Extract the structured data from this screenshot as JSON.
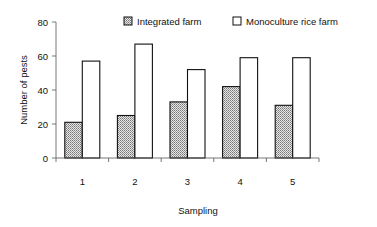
{
  "chart_data": {
    "type": "bar",
    "title": "",
    "xlabel": "Sampling",
    "ylabel": "Number of pests",
    "categories": [
      "1",
      "2",
      "3",
      "4",
      "5"
    ],
    "series": [
      {
        "name": "Integrated farm",
        "values": [
          21,
          25,
          33,
          42,
          31
        ],
        "fill": "dotted-gray"
      },
      {
        "name": "Monoculture rice farm",
        "values": [
          57,
          67,
          52,
          59,
          59
        ],
        "fill": "#ffffff"
      }
    ],
    "ylim": [
      0,
      80
    ],
    "yticks": [
      "0",
      "20",
      "40",
      "60",
      "80"
    ],
    "grid": false,
    "legend_position": "top"
  }
}
